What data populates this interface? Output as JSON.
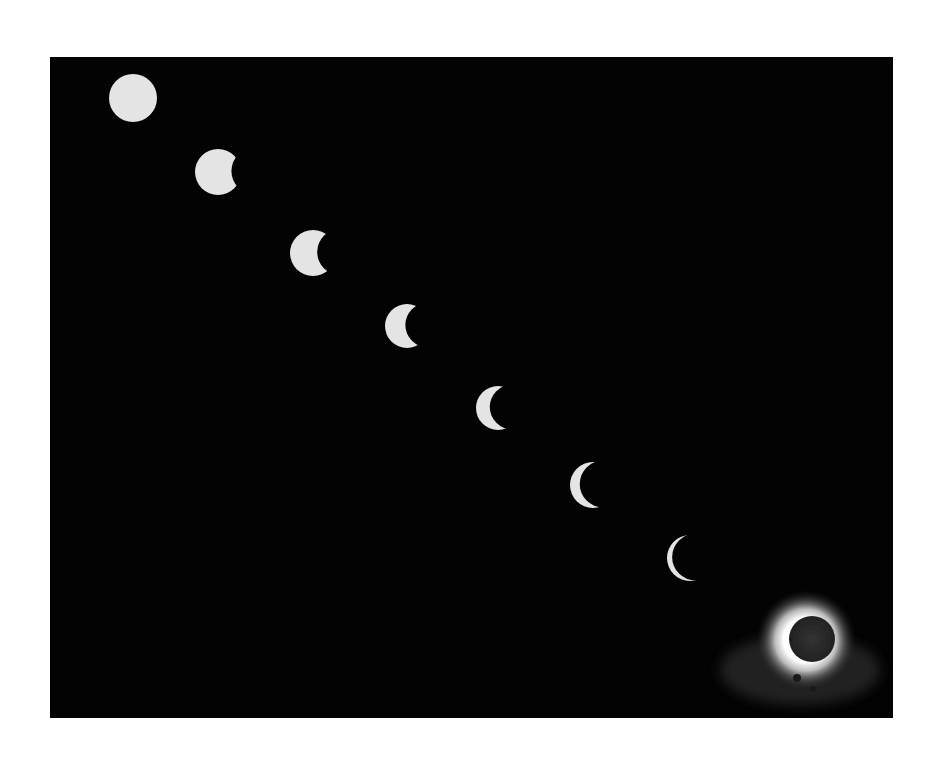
{
  "image": {
    "subject": "Sequence of solar eclipse phases from full sun to totality",
    "background_color": "#ffffff",
    "frame": {
      "x": 50,
      "y": 57,
      "width": 843,
      "height": 661,
      "color": "#030303"
    },
    "sun_color": "#e4e4e4",
    "corona_color": "#ffffff",
    "moon_color": "#2a2a2a"
  },
  "phases": [
    {
      "label": "full-sun",
      "cx": 133,
      "cy": 98,
      "r": 24,
      "occlusion": 0.0
    },
    {
      "label": "partial-1",
      "cx": 218,
      "cy": 172,
      "r": 23,
      "occlusion": 0.22
    },
    {
      "label": "partial-2",
      "cx": 313,
      "cy": 253,
      "r": 23,
      "occlusion": 0.42
    },
    {
      "label": "partial-3",
      "cx": 407,
      "cy": 326,
      "r": 22,
      "occlusion": 0.55
    },
    {
      "label": "partial-4",
      "cx": 498,
      "cy": 408,
      "r": 22,
      "occlusion": 0.7
    },
    {
      "label": "partial-5",
      "cx": 593,
      "cy": 485,
      "r": 23,
      "occlusion": 0.8
    },
    {
      "label": "partial-6",
      "cx": 690,
      "cy": 558,
      "r": 23,
      "occlusion": 0.9
    }
  ],
  "totality": {
    "label": "total-eclipse-corona",
    "cx": 810,
    "cy": 640,
    "moon_r": 23,
    "corona_r": 50,
    "prominences": [
      {
        "x": 791,
        "y": 639,
        "r": 1.5
      },
      {
        "x": 797,
        "y": 678,
        "r": 4
      },
      {
        "x": 813,
        "y": 689,
        "r": 3
      },
      {
        "x": 842,
        "y": 694,
        "r": 2
      }
    ]
  }
}
